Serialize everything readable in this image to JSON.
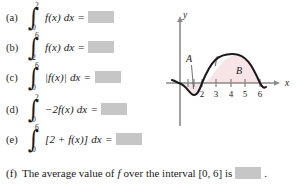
{
  "parts": [
    {
      "label": "(a)",
      "lower": "0",
      "upper": "2",
      "integrand": "f(x)",
      "dx": "dx",
      "equals": "=",
      "answer": ""
    },
    {
      "label": "(b)",
      "lower": "2",
      "upper": "6",
      "integrand": "f(x)",
      "dx": "dx",
      "equals": "=",
      "answer": ""
    },
    {
      "label": "(c)",
      "lower": "0",
      "upper": "6",
      "integrand": "|f(x)|",
      "dx": "dx",
      "equals": "=",
      "answer": ""
    },
    {
      "label": "(d)",
      "lower": "0",
      "upper": "2",
      "integrand": "−2f(x)",
      "dx": "dx",
      "equals": "=",
      "answer": ""
    },
    {
      "label": "(e)",
      "lower": "0",
      "upper": "6",
      "integrand": "[2 + f(x)]",
      "dx": "dx",
      "equals": "=",
      "answer": ""
    }
  ],
  "part_f": {
    "label": "(f)",
    "text_before": "The average value of",
    "function_symbol": "f",
    "text_middle": "over the interval [0, 6] is",
    "answer": "",
    "text_after": "."
  },
  "figure": {
    "y_axis_label": "y",
    "x_axis_label": "x",
    "curve_label": "f",
    "region_below_label": "A",
    "region_above_label": "B",
    "x_ticks": [
      "2",
      "3",
      "4",
      "5",
      "6"
    ],
    "colors": {
      "curve": "#1a1a1a",
      "axis": "#8a8a8a",
      "shade": "#f7e4e6",
      "answer_box": "#c6c6c6"
    }
  }
}
